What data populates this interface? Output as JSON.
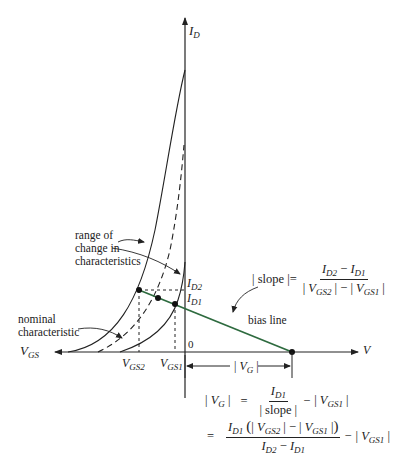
{
  "figure": {
    "axes": {
      "y_axis_label": "I",
      "y_axis_sub": "D",
      "x_axis_left_label": "V",
      "x_axis_left_sub": "GS",
      "x_axis_right_label": "V",
      "origin_label": "0"
    },
    "levels": {
      "id2_label": "I",
      "id2_sub": "D2",
      "id1_label": "I",
      "id1_sub": "D1",
      "vgs2_label": "V",
      "vgs2_sub": "GS2",
      "vgs1_label": "V",
      "vgs1_sub": "GS1"
    },
    "annotations": {
      "range_line1": "range of",
      "range_line2": "change in",
      "range_line3": "characteristics",
      "nominal_line1": "nominal",
      "nominal_line2": "characteristic",
      "bias_line": "bias line"
    },
    "vg_dimension": {
      "bar_left": "|",
      "label": "V",
      "sub": "G",
      "bar_right": "|"
    },
    "slope_formula": {
      "lhs": "| slope |=",
      "num_a": "I",
      "num_a_sub": "D2",
      "num_op": "−",
      "num_b": "I",
      "num_b_sub": "D1",
      "den_a_pre": "|",
      "den_a": "V",
      "den_a_sub": "GS2",
      "den_mid": "| − |",
      "den_b": "V",
      "den_b_sub": "GS1",
      "den_post": "|"
    },
    "vg_formula_1": {
      "lhs_pre": "|",
      "lhs": "V",
      "lhs_sub": "G",
      "lhs_post": "|",
      "eq": "=",
      "num": "I",
      "num_sub": "D1",
      "den": "| slope |",
      "tail_op": "−",
      "tail_pre": "|",
      "tail": "V",
      "tail_sub": "GS1",
      "tail_post": "|"
    },
    "vg_formula_2": {
      "eq": "=",
      "num_a": "I",
      "num_a_sub": "D1",
      "num_paren_open": "(",
      "num_b_pre": "|",
      "num_b": "V",
      "num_b_sub": "GS2",
      "num_mid": "| − |",
      "num_c": "V",
      "num_c_sub": "GS1",
      "num_c_post": "|",
      "num_paren_close": ")",
      "den_a": "I",
      "den_a_sub": "D2",
      "den_op": "−",
      "den_b": "I",
      "den_b_sub": "D1",
      "tail_op": "−",
      "tail_pre": "|",
      "tail": "V",
      "tail_sub": "GS1",
      "tail_post": "|"
    },
    "colors": {
      "line": "#222222",
      "bias_line": "#2e6b3f"
    }
  }
}
